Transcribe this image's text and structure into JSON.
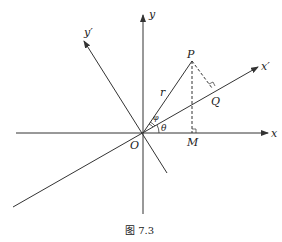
{
  "figure": {
    "caption": "图 7.3"
  },
  "labels": {
    "x_axis": "x",
    "y_axis": "y",
    "x_prime_axis": "x′",
    "y_prime_axis": "y′",
    "origin": "O",
    "point_p": "P",
    "point_q": "Q",
    "point_m": "M",
    "radius": "r",
    "theta": "θ",
    "phi": "φ"
  },
  "colors": {
    "line": "#333333",
    "background": "#ffffff"
  }
}
